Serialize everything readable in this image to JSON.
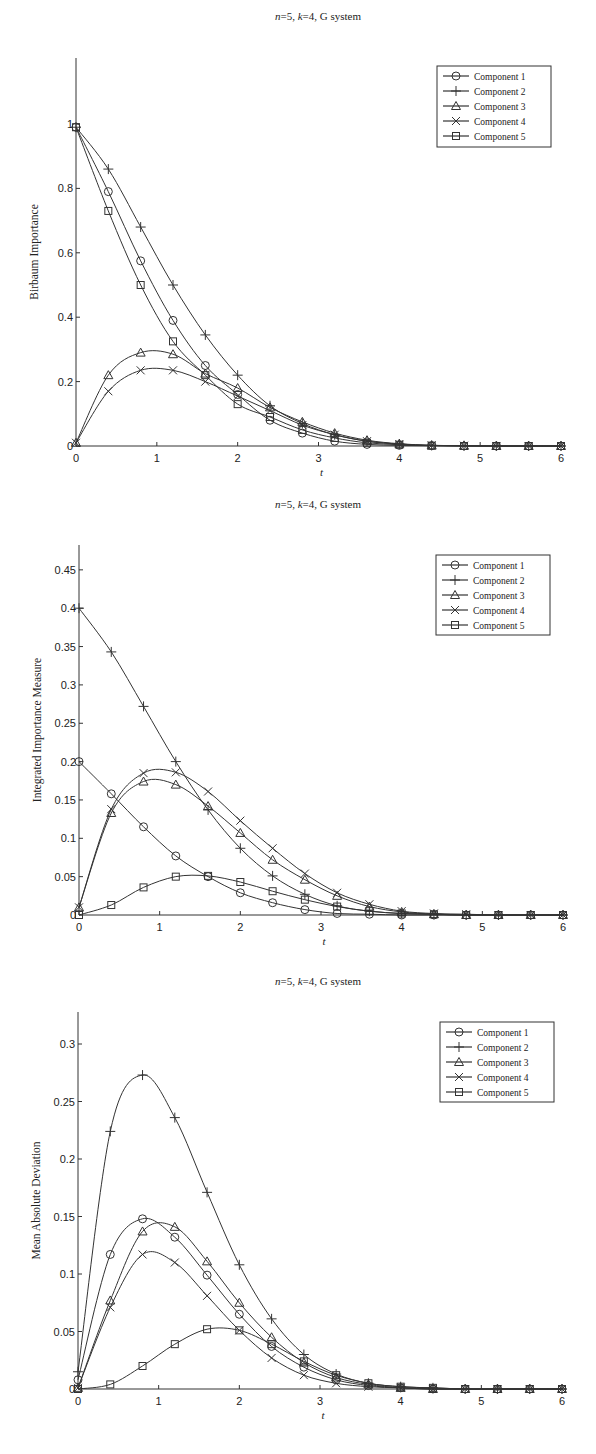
{
  "chart_data": [
    {
      "type": "line",
      "title": "n=5, k=4, G system",
      "title_parts": {
        "n": "n",
        "n_val": "=5, ",
        "k": "k",
        "k_val": "=4, G system"
      },
      "xlabel": "t",
      "ylabel": "Birbaum Importance",
      "xlim": [
        0,
        6
      ],
      "ylim": [
        0,
        1.18
      ],
      "xticks": [
        0,
        1,
        2,
        3,
        4,
        5,
        6
      ],
      "yticks": [
        0,
        0.2,
        0.4,
        0.6,
        0.8,
        1
      ],
      "ytick_labels": [
        "0",
        "0.2",
        "0.4",
        "0.6",
        "0.8",
        "1"
      ],
      "grid": false,
      "legend_position": "upper right",
      "x": [
        0,
        0.4,
        0.8,
        1.2,
        1.6,
        2.0,
        2.4,
        2.8,
        3.2,
        3.6,
        4.0,
        4.4,
        4.8,
        5.2,
        5.6,
        6.0
      ],
      "series": [
        {
          "name": "Component 1",
          "marker": "circle",
          "values": [
            0.99,
            0.79,
            0.575,
            0.39,
            0.25,
            0.16,
            0.08,
            0.04,
            0.015,
            0.005,
            0.002,
            0.001,
            0,
            0,
            0,
            0
          ]
        },
        {
          "name": "Component 2",
          "marker": "plus",
          "values": [
            0.99,
            0.86,
            0.68,
            0.5,
            0.345,
            0.22,
            0.125,
            0.07,
            0.035,
            0.015,
            0.006,
            0.002,
            0.001,
            0,
            0,
            0
          ]
        },
        {
          "name": "Component 3",
          "marker": "triangle",
          "values": [
            0.01,
            0.22,
            0.29,
            0.285,
            0.225,
            0.18,
            0.12,
            0.075,
            0.04,
            0.018,
            0.007,
            0.002,
            0.001,
            0,
            0,
            0
          ]
        },
        {
          "name": "Component 4",
          "marker": "x",
          "values": [
            0.01,
            0.17,
            0.235,
            0.235,
            0.2,
            0.155,
            0.11,
            0.065,
            0.035,
            0.015,
            0.006,
            0.002,
            0.001,
            0,
            0,
            0
          ]
        },
        {
          "name": "Component 5",
          "marker": "square",
          "values": [
            0.99,
            0.73,
            0.5,
            0.325,
            0.22,
            0.13,
            0.09,
            0.05,
            0.025,
            0.01,
            0.004,
            0.001,
            0,
            0,
            0,
            0
          ]
        }
      ],
      "frame": {
        "x0": 76,
        "x1": 561,
        "y0": 446,
        "ytop": 58,
        "yscale_px_per_unit": 322
      }
    },
    {
      "type": "line",
      "title": "n=5, k=4, G system",
      "title_parts": {
        "n": "n",
        "n_val": "=5, ",
        "k": "k",
        "k_val": "=4, G system"
      },
      "xlabel": "t",
      "ylabel": "Integrated Importance Measure",
      "xlim": [
        0,
        6
      ],
      "ylim": [
        0,
        0.48
      ],
      "xticks": [
        0,
        1,
        2,
        3,
        4,
        5,
        6
      ],
      "yticks": [
        0,
        0.05,
        0.1,
        0.15,
        0.2,
        0.25,
        0.3,
        0.35,
        0.4,
        0.45
      ],
      "ytick_labels": [
        "0",
        "0.05",
        "0.1",
        "0.15",
        "0.2",
        "0.25",
        "0.3",
        "0.35",
        "0.4",
        "0.45"
      ],
      "grid": false,
      "legend_position": "upper right",
      "x": [
        0,
        0.4,
        0.8,
        1.2,
        1.6,
        2.0,
        2.4,
        2.8,
        3.2,
        3.6,
        4.0,
        4.4,
        4.8,
        5.2,
        5.6,
        6.0
      ],
      "series": [
        {
          "name": "Component 1",
          "marker": "circle",
          "values": [
            0.2,
            0.158,
            0.115,
            0.077,
            0.05,
            0.029,
            0.016,
            0.007,
            0.002,
            0.001,
            0,
            0,
            0,
            0,
            0,
            0
          ]
        },
        {
          "name": "Component 2",
          "marker": "plus",
          "values": [
            0.4,
            0.343,
            0.272,
            0.2,
            0.137,
            0.087,
            0.051,
            0.027,
            0.012,
            0.005,
            0.002,
            0.001,
            0,
            0,
            0,
            0
          ]
        },
        {
          "name": "Component 3",
          "marker": "triangle",
          "values": [
            0.01,
            0.133,
            0.174,
            0.17,
            0.142,
            0.107,
            0.072,
            0.046,
            0.025,
            0.011,
            0.004,
            0.001,
            0,
            0,
            0,
            0
          ]
        },
        {
          "name": "Component 4",
          "marker": "x",
          "values": [
            0.01,
            0.138,
            0.185,
            0.186,
            0.161,
            0.123,
            0.087,
            0.054,
            0.029,
            0.014,
            0.005,
            0.002,
            0.001,
            0,
            0,
            0
          ]
        },
        {
          "name": "Component 5",
          "marker": "square",
          "values": [
            0,
            0.013,
            0.036,
            0.05,
            0.051,
            0.043,
            0.031,
            0.02,
            0.011,
            0.005,
            0.002,
            0.001,
            0,
            0,
            0,
            0
          ]
        }
      ],
      "frame": {
        "x0": 79,
        "x1": 563,
        "y0": 915,
        "ytop": 545,
        "yscale_px_per_unit": 767
      }
    },
    {
      "type": "line",
      "title": "n=5, k=4, G system",
      "title_parts": {
        "n": "n",
        "n_val": "=5, ",
        "k": "k",
        "k_val": "=4, G system"
      },
      "xlabel": "t",
      "ylabel": "Mean Absolute Deviation",
      "xlim": [
        0,
        6
      ],
      "ylim": [
        0,
        0.33
      ],
      "xticks": [
        0,
        1,
        2,
        3,
        4,
        5,
        6
      ],
      "yticks": [
        0,
        0.05,
        0.1,
        0.15,
        0.2,
        0.25,
        0.3
      ],
      "ytick_labels": [
        "0",
        "0.05",
        "0.1",
        "0.15",
        "0.2",
        "0.25",
        "0.3"
      ],
      "grid": false,
      "legend_position": "upper right",
      "x": [
        0,
        0.4,
        0.8,
        1.2,
        1.6,
        2.0,
        2.4,
        2.8,
        3.2,
        3.6,
        4.0,
        4.4,
        4.8,
        5.2,
        5.6,
        6.0
      ],
      "series": [
        {
          "name": "Component 1",
          "marker": "circle",
          "values": [
            0.008,
            0.117,
            0.148,
            0.132,
            0.099,
            0.065,
            0.037,
            0.019,
            0.008,
            0.003,
            0.001,
            0,
            0,
            0,
            0,
            0
          ]
        },
        {
          "name": "Component 2",
          "marker": "plus",
          "values": [
            0.015,
            0.224,
            0.273,
            0.236,
            0.171,
            0.108,
            0.061,
            0.03,
            0.013,
            0.005,
            0.002,
            0.001,
            0,
            0,
            0,
            0
          ]
        },
        {
          "name": "Component 3",
          "marker": "triangle",
          "values": [
            0.001,
            0.077,
            0.137,
            0.141,
            0.111,
            0.075,
            0.045,
            0.023,
            0.01,
            0.004,
            0.001,
            0,
            0,
            0,
            0,
            0
          ]
        },
        {
          "name": "Component 4",
          "marker": "x",
          "values": [
            0.001,
            0.071,
            0.117,
            0.11,
            0.081,
            0.051,
            0.027,
            0.012,
            0.005,
            0.002,
            0.001,
            0,
            0,
            0,
            0,
            0
          ]
        },
        {
          "name": "Component 5",
          "marker": "square",
          "values": [
            0,
            0.004,
            0.02,
            0.039,
            0.052,
            0.051,
            0.039,
            0.024,
            0.012,
            0.005,
            0.002,
            0.001,
            0,
            0,
            0,
            0
          ]
        }
      ],
      "frame": {
        "x0": 78,
        "x1": 562,
        "y0": 1389,
        "ytop": 1012,
        "yscale_px_per_unit": 1150
      }
    }
  ],
  "layout": {
    "titles_y": [
      20,
      508,
      985
    ],
    "title_x": 318,
    "legends": [
      {
        "x": 437,
        "y": 66,
        "w": 114,
        "h": 81
      },
      {
        "x": 436,
        "y": 555,
        "w": 114,
        "h": 80
      },
      {
        "x": 440,
        "y": 1022,
        "w": 114,
        "h": 80
      }
    ]
  }
}
